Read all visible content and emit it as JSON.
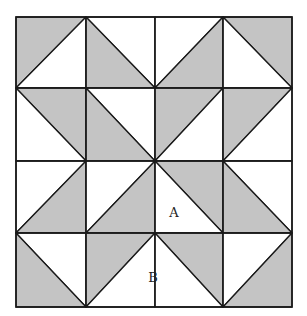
{
  "figure": {
    "type": "quilt-block-diagram",
    "grid_size": 4,
    "colors": {
      "shade": "#c4c4c4",
      "light": "#ffffff",
      "stroke": "#1a1a1a"
    },
    "grid_x": [
      16,
      86,
      155,
      223,
      292
    ],
    "grid_y": [
      17,
      88,
      161,
      233,
      307
    ],
    "cells": [
      {
        "col": 0,
        "row": 0,
        "diagonal": "TR-BL",
        "shaded": "upper-left"
      },
      {
        "col": 1,
        "row": 0,
        "diagonal": "TL-BR",
        "shaded": "lower-left"
      },
      {
        "col": 2,
        "row": 0,
        "diagonal": "TR-BL",
        "shaded": "lower-right"
      },
      {
        "col": 3,
        "row": 0,
        "diagonal": "TL-BR",
        "shaded": "upper-right"
      },
      {
        "col": 0,
        "row": 1,
        "diagonal": "TL-BR",
        "shaded": "upper-right"
      },
      {
        "col": 1,
        "row": 1,
        "diagonal": "TL-BR",
        "shaded": "lower-left"
      },
      {
        "col": 2,
        "row": 1,
        "diagonal": "TR-BL",
        "shaded": "upper-left"
      },
      {
        "col": 3,
        "row": 1,
        "diagonal": "TR-BL",
        "shaded": "upper-left"
      },
      {
        "col": 0,
        "row": 2,
        "diagonal": "TR-BL",
        "shaded": "lower-right"
      },
      {
        "col": 1,
        "row": 2,
        "diagonal": "TR-BL",
        "shaded": "lower-right"
      },
      {
        "col": 2,
        "row": 2,
        "diagonal": "TL-BR",
        "shaded": "upper-right"
      },
      {
        "col": 3,
        "row": 2,
        "diagonal": "TL-BR",
        "shaded": "lower-left"
      },
      {
        "col": 0,
        "row": 3,
        "diagonal": "TL-BR",
        "shaded": "lower-left"
      },
      {
        "col": 1,
        "row": 3,
        "diagonal": "TR-BL",
        "shaded": "upper-left"
      },
      {
        "col": 2,
        "row": 3,
        "diagonal": "TL-BR",
        "shaded": "upper-right"
      },
      {
        "col": 3,
        "row": 3,
        "diagonal": "TR-BL",
        "shaded": "lower-right"
      }
    ],
    "labels": [
      {
        "text": "A",
        "x": 174,
        "y": 217
      },
      {
        "text": "B",
        "x": 153,
        "y": 282
      }
    ]
  }
}
